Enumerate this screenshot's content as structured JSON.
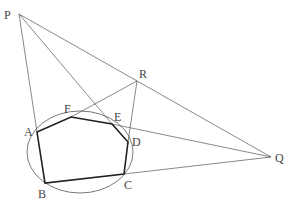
{
  "diagram": {
    "title": "",
    "points": {
      "P": {
        "label": "P",
        "x": 19,
        "y": 14
      },
      "R": {
        "label": "R",
        "x": 137,
        "y": 81
      },
      "Q": {
        "label": "Q",
        "x": 271,
        "y": 157
      },
      "A": {
        "label": "A",
        "x": 37,
        "y": 132
      },
      "F": {
        "label": "F",
        "x": 71,
        "y": 117
      },
      "E": {
        "label": "E",
        "x": 112,
        "y": 124
      },
      "D": {
        "label": "D",
        "x": 128,
        "y": 142
      },
      "C": {
        "label": "C",
        "x": 124,
        "y": 174
      },
      "B": {
        "label": "B",
        "x": 45,
        "y": 183
      }
    },
    "hexagon": [
      "A",
      "F",
      "E",
      "D",
      "C",
      "B"
    ],
    "lines": [
      [
        "P",
        "Q"
      ],
      [
        "P",
        "B"
      ],
      [
        "P",
        "D"
      ],
      [
        "R",
        "F"
      ],
      [
        "R",
        "C"
      ],
      [
        "Q",
        "F"
      ],
      [
        "Q",
        "C"
      ]
    ],
    "ellipse": {
      "cx": 80,
      "cy": 152,
      "rx": 53,
      "ry": 41
    },
    "colors": {
      "thin": "#555555",
      "thick": "#222222"
    }
  }
}
